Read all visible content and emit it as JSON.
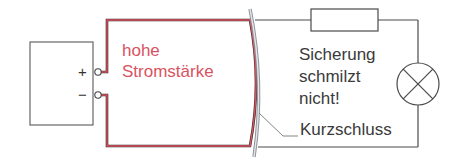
{
  "diagram": {
    "type": "circuit",
    "source": {
      "terminal_plus": "+",
      "terminal_minus": "−"
    },
    "labels": {
      "high_current_line1": "hohe",
      "high_current_line2": "Stromstärke",
      "fuse_line1": "Sicherung",
      "fuse_line2": "schmilzt",
      "fuse_line3": "nicht!",
      "short_circuit": "Kurzschluss"
    },
    "components": [
      "voltage-source",
      "fuse",
      "lamp",
      "short-circuit-wire"
    ],
    "colors": {
      "high_current_wire": "#c0394a",
      "normal_wire": "#555555",
      "high_current_text": "#d9535f",
      "text": "#3a3a3a",
      "short_wire": "#a9adb6"
    }
  }
}
